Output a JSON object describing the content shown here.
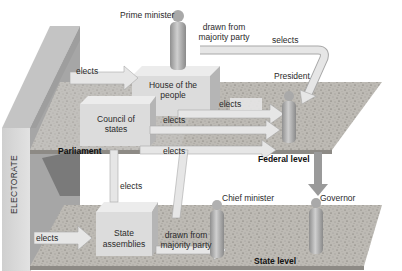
{
  "diagram": {
    "levels": {
      "parliament": "Parliament",
      "federal": "Federal level",
      "state": "State level"
    },
    "sidebar_label": "ELECTORATE",
    "bodies": {
      "house_of_people_line1": "House of the",
      "house_of_people_line2": "people",
      "council_of_states_line1": "Council of",
      "council_of_states_line2": "states",
      "state_assemblies_line1": "State",
      "state_assemblies_line2": "assemblies"
    },
    "figures": {
      "prime_minister": "Prime minister",
      "president": "President",
      "chief_minister": "Chief minister",
      "governor": "Governor"
    },
    "arrows": {
      "electorate_to_house": "elects",
      "house_to_president": "elects",
      "council_to_president": "elects",
      "parliament_to_president": "elects",
      "state_to_council": "elects",
      "electorate_to_state": "elects",
      "pm_drawn_from_line1": "drawn from",
      "pm_drawn_from_line2": "majority party",
      "pm_selects": "selects",
      "cm_drawn_from_line1": "drawn from",
      "cm_drawn_from_line2": "majority party"
    },
    "colors": {
      "platform": "#b9b6b0",
      "platform_speckle": "#6e6b66",
      "wall_front": "#d6d6d6",
      "wall_side": "#a9a9a9",
      "box_front": "#dcdcdc",
      "box_top": "#ececec",
      "box_side": "#b8b8b8",
      "arrow": "#e6e6e6",
      "arrow_shadow": "#a8a8a8",
      "figure": "#a9a9a9"
    }
  }
}
